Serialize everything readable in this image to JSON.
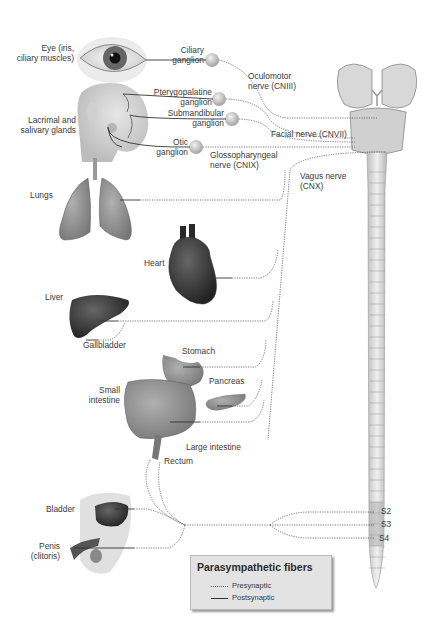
{
  "figure": {
    "targets": {
      "eye": "Eye (iris,\nciliary muscles)",
      "glands": "Lacrimal and\nsalivary glands",
      "lungs": "Lungs",
      "heart": "Heart",
      "liver": "Liver",
      "gallbladder": "Gallbladder",
      "stomach": "Stomach",
      "pancreas": "Pancreas",
      "small_intestine": "Small\nintestine",
      "large_intestine": "Large intestine",
      "rectum": "Rectum",
      "bladder": "Bladder",
      "penis": "Penis\n(clitoris)"
    },
    "ganglia": {
      "ciliary": "Ciliary\nganglion",
      "pterygopalatine": "Pterygopalatine\nganglion",
      "submandibular": "Submandibular\nganglion",
      "otic": "Otic\nganglion"
    },
    "nerves": {
      "oculomotor": "Oculomotor\nnerve (CNIII)",
      "facial": "Facial nerve (CNVII)",
      "glossopharyngeal": "Glossopharyngeal\nnerve (CNIX)",
      "vagus": "Vagus nerve\n(CNX)"
    },
    "spinal_segments": [
      "S2",
      "S3",
      "S4"
    ]
  },
  "legend": {
    "title": "Parasympathetic fibers",
    "items": [
      {
        "label": "Presynaptic",
        "style": "dotted"
      },
      {
        "label": "Postsynaptic",
        "style": "solid"
      }
    ]
  },
  "colors": {
    "background": "#ffffff",
    "line": "#555555",
    "organ": "#8a8a8a",
    "dark_organ": "#3a3a3a",
    "legend_bg": "#e3e3e3",
    "cord": "#dcdcdc"
  }
}
